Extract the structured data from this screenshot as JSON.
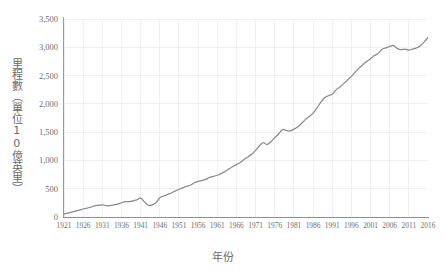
{
  "chart_data": {
    "type": "line",
    "title": "",
    "xlabel": "年份",
    "ylabel": "里程數（單位10億英里）",
    "xlim": [
      1921,
      2016
    ],
    "ylim": [
      0,
      3500
    ],
    "grid": true,
    "legend": false,
    "legend_position": "none",
    "line_color": "#8a8a8a",
    "gridline_color": "#ececec",
    "axis_color": "#929292",
    "y_ticks": [
      0,
      500,
      1000,
      1500,
      2000,
      2500,
      3000,
      3500
    ],
    "y_tick_labels": [
      "0",
      "500",
      "1,000",
      "1,500",
      "2,000",
      "2,500",
      "3,000",
      "3,500"
    ],
    "x_ticks": [
      1921,
      1926,
      1931,
      1936,
      1941,
      1946,
      1951,
      1956,
      1961,
      1966,
      1971,
      1976,
      1981,
      1986,
      1991,
      1996,
      2001,
      2006,
      2011,
      2016
    ],
    "x_tick_labels": [
      "1921",
      "1926",
      "1931",
      "1936",
      "1941",
      "1946",
      "1951",
      "1956",
      "1961",
      "1966",
      "1971",
      "1976",
      "1981",
      "1986",
      "1991",
      "1996",
      "2001",
      "2006",
      "2011",
      "2016"
    ],
    "series": [
      {
        "name": "里程數",
        "x": [
          1921,
          1922,
          1923,
          1924,
          1925,
          1926,
          1927,
          1928,
          1929,
          1930,
          1931,
          1932,
          1933,
          1934,
          1935,
          1936,
          1937,
          1938,
          1939,
          1940,
          1941,
          1942,
          1943,
          1944,
          1945,
          1946,
          1947,
          1948,
          1949,
          1950,
          1951,
          1952,
          1953,
          1954,
          1955,
          1956,
          1957,
          1958,
          1959,
          1960,
          1961,
          1962,
          1963,
          1964,
          1965,
          1966,
          1967,
          1968,
          1969,
          1970,
          1971,
          1972,
          1973,
          1974,
          1975,
          1976,
          1977,
          1978,
          1979,
          1980,
          1981,
          1982,
          1983,
          1984,
          1985,
          1986,
          1987,
          1988,
          1989,
          1990,
          1991,
          1992,
          1993,
          1994,
          1995,
          1996,
          1997,
          1998,
          1999,
          2000,
          2001,
          2002,
          2003,
          2004,
          2005,
          2006,
          2007,
          2008,
          2009,
          2010,
          2011,
          2012,
          2013,
          2014,
          2015,
          2016
        ],
        "values": [
          55,
          67,
          85,
          104,
          122,
          141,
          158,
          173,
          198,
          206,
          216,
          200,
          201,
          216,
          229,
          252,
          270,
          271,
          285,
          302,
          334,
          268,
          208,
          213,
          250,
          341,
          371,
          398,
          424,
          458,
          491,
          514,
          544,
          562,
          606,
          628,
          647,
          665,
          700,
          719,
          738,
          767,
          805,
          847,
          888,
          926,
          965,
          1016,
          1062,
          1110,
          1179,
          1260,
          1313,
          1281,
          1330,
          1402,
          1467,
          1545,
          1529,
          1521,
          1553,
          1595,
          1653,
          1721,
          1775,
          1835,
          1924,
          2026,
          2107,
          2144,
          2172,
          2247,
          2297,
          2358,
          2423,
          2486,
          2562,
          2632,
          2691,
          2747,
          2797,
          2856,
          2890,
          2965,
          2989,
          3014,
          3031,
          2977,
          2957,
          2967,
          2950,
          2969,
          2988,
          3026,
          3095,
          3174
        ]
      }
    ],
    "annotations": []
  }
}
